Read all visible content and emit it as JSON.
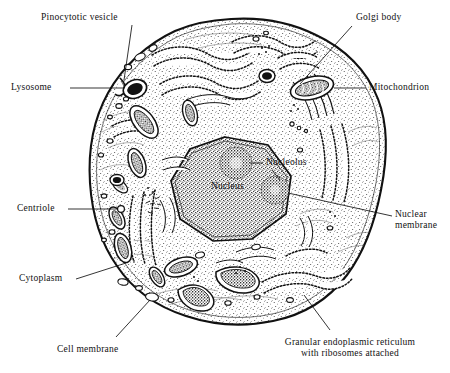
{
  "figure": {
    "style": "black-and-white stippled line drawing",
    "ink_color": "#111111",
    "background_color": "#ffffff"
  },
  "labels": [
    {
      "id": "pinocytotic-vesicle",
      "text": "Pinocytotic vesicle",
      "align": "left",
      "x": 41,
      "y": 14,
      "leader": [
        [
          132,
          25
        ],
        [
          178,
          56
        ]
      ]
    },
    {
      "id": "golgi-body",
      "text": "Golgi body",
      "align": "left",
      "x": 356,
      "y": 14,
      "leader": [
        [
          354,
          25
        ],
        [
          268,
          80
        ]
      ]
    },
    {
      "id": "lysosome",
      "text": "Lysosome",
      "align": "left",
      "x": 11,
      "y": 81,
      "leader": [
        [
          70,
          88
        ],
        [
          133,
          88
        ]
      ]
    },
    {
      "id": "mitochondrion",
      "text": "Mitochondrion",
      "align": "left",
      "x": 368,
      "y": 81,
      "leader": [
        [
          364,
          88
        ],
        [
          330,
          88
        ]
      ]
    },
    {
      "id": "nucleolus",
      "text": "Nucleolus",
      "align": "left",
      "x": 265,
      "y": 157,
      "leader": [
        [
          262,
          163
        ],
        [
          244,
          163
        ]
      ]
    },
    {
      "id": "nucleolus-leader2",
      "text": "",
      "align": "left",
      "x": 0,
      "y": 0,
      "leader": [
        [
          272,
          170
        ],
        [
          281,
          186
        ]
      ]
    },
    {
      "id": "nucleus",
      "text": "Nucleus",
      "align": "left",
      "x": 212,
      "y": 182,
      "leader": []
    },
    {
      "id": "centriole",
      "text": "Centriole",
      "align": "left",
      "x": 17,
      "y": 202,
      "leader": [
        [
          68,
          209
        ],
        [
          117,
          209
        ]
      ]
    },
    {
      "id": "nuclear-membrane",
      "text": "Nuclear\nmembrane",
      "align": "left",
      "x": 394,
      "y": 209,
      "leader": [
        [
          390,
          216
        ],
        [
          286,
          190
        ]
      ]
    },
    {
      "id": "cytoplasm",
      "text": "Cytoplasm",
      "align": "left",
      "x": 19,
      "y": 272,
      "leader": [
        [
          74,
          279
        ],
        [
          122,
          266
        ]
      ]
    },
    {
      "id": "cell-membrane",
      "text": "Cell membrane",
      "align": "left",
      "x": 57,
      "y": 344,
      "leader": [
        [
          114,
          338
        ],
        [
          148,
          302
        ]
      ]
    },
    {
      "id": "granular-er",
      "text": "Granular endoplasmic reticulum\nwith ribosomes attached",
      "align": "center",
      "x": 260,
      "y": 338,
      "leader": [
        [
          330,
          332
        ],
        [
          305,
          296
        ]
      ]
    }
  ],
  "structures": {
    "cell_membrane": "rough organic near-circular outline with a notch at upper-left",
    "nucleus": "irregular polygonal nucleus, pale center, dark stippled rim",
    "nucleoli": 2,
    "organelles": [
      "rough endoplasmic reticulum",
      "mitochondrion",
      "lysosome",
      "golgi body",
      "centriole",
      "pinocytotic vesicle",
      "vesicles"
    ]
  }
}
